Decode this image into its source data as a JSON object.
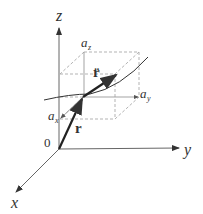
{
  "diagram": {
    "axes": {
      "x_label": "x",
      "y_label": "y",
      "z_label": "z",
      "origin_label": "0"
    },
    "vectors": {
      "position_label": "r",
      "acceleration_label": "r̈"
    },
    "components": {
      "ax_label": "a",
      "ax_sub": "x",
      "ay_label": "a",
      "ay_sub": "y",
      "az_label": "a",
      "az_sub": "z"
    },
    "colors": {
      "axis": "#666666",
      "vector": "#222222",
      "dashed_box": "#aaaaaa",
      "curve": "#333333"
    }
  }
}
